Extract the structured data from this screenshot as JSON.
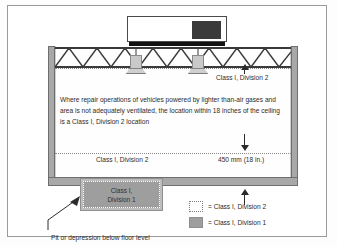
{
  "figure": {
    "body_text": "Where repair operations of vehicles powered by lighter than-air gases and area is not adequately ventilated, the location within 18 inches of the ceiling is a Class I, Division 2 location",
    "callouts": {
      "ceiling_zone": "Class I, Division 2",
      "floor_zone": "Class I, Division 2",
      "dimension": "450 mm (18 in.)",
      "pit_note": "Pit or depression below floor level"
    },
    "pit": {
      "label_line1": "Class I,",
      "label_line2": "Division 1"
    },
    "legend": [
      {
        "swatch": "dotted-outline-swatch",
        "label": "= Class I, Division 2"
      },
      {
        "swatch": "solid-gray-swatch",
        "label": "= Class I, Division 1"
      }
    ],
    "colors": {
      "wall": "#a8a8a8",
      "pit_fill": "#9e9e9e",
      "division1_swatch": "#9e9e9e",
      "division2_swatch": "#ffffff",
      "zone_line": "#8a8a8a",
      "roof_vent": "#3a3a3a",
      "frame_border": "#9a9a9a"
    },
    "icons": {
      "arrow_up": "arrow-up-icon",
      "arrow_down": "arrow-down-icon",
      "leader_arrow": "leader-arrow-icon"
    }
  }
}
